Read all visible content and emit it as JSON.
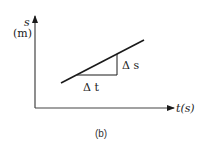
{
  "diagram": {
    "type": "position-time graph",
    "caption": "(b)",
    "y_axis": {
      "symbol": "s",
      "unit": "(m)"
    },
    "x_axis": {
      "label": "t(s)"
    },
    "line": {
      "description": "straight line with positive slope"
    },
    "triangle": {
      "horizontal_label": "Δ t",
      "vertical_label": "Δ s"
    },
    "colors": {
      "stroke": "#1a1a1a",
      "background": "#ffffff"
    }
  }
}
